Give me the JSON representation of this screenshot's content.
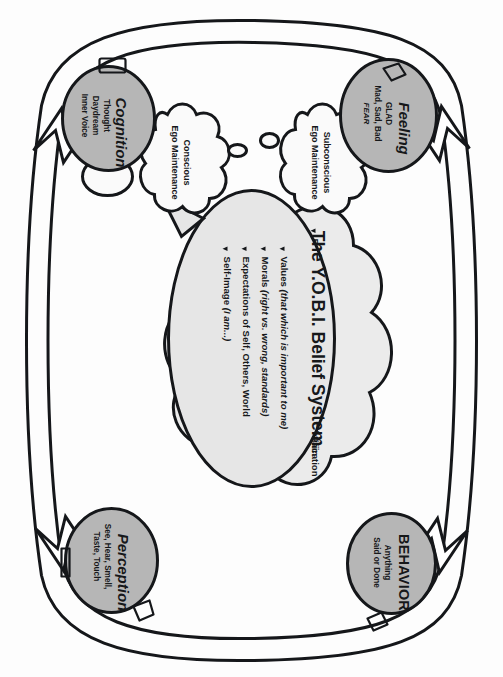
{
  "diagram": {
    "orientation": "page rotated 90 degrees clockwise",
    "colors": {
      "node_fill": "#b6b6b6",
      "belief_fill": "#e6e6e6",
      "ego_fill": "#ebebeb",
      "cloud_fill": "#fafafa",
      "line": "#15171a"
    }
  },
  "nodes": {
    "feeling": {
      "title": "Feeling",
      "line1": "GLAD",
      "line2": "Mad, Sad, Bad",
      "line3": "FEAR"
    },
    "behavior": {
      "title": "BEHAVIOR",
      "line1": "Anything",
      "line2": "Said or Done"
    },
    "perception": {
      "title": "Perception",
      "line1": "See, Hear, Smell,",
      "line2": "Taste, Touch"
    },
    "cognition": {
      "title": "Cognition",
      "line1": "Thought",
      "line2": "Daydream",
      "line3": "Inner Voice"
    }
  },
  "belief_system": {
    "title": "The Y.O.B.I. Belief System",
    "bullets": [
      {
        "lead": "Values ",
        "emph": "(that which is important to me)"
      },
      {
        "lead": "Morals ",
        "emph": "(right vs. wrong, standards)"
      },
      {
        "lead": "Expectations of Self, Others, World",
        "emph": ""
      },
      {
        "lead": "Self-Image ",
        "emph": "(I am...)"
      }
    ]
  },
  "ego_agenda": {
    "title": "The Ego Agenda",
    "bullets": [
      "Minimize Emotional & Physical Pain",
      "Maximize Emotional & Physical Gratification",
      "Establish & Maintain Power & Control",
      "Establish & Maintain Ego-Ideal"
    ]
  },
  "clouds": {
    "subconscious": {
      "line1": "Subconscious",
      "line2": "Ego Maintenance"
    },
    "conscious": {
      "line1": "Conscious",
      "line2": "Ego Maintenance"
    }
  }
}
